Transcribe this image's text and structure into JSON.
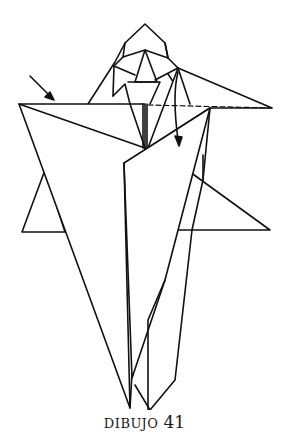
{
  "figure": {
    "type": "origami-diagram",
    "caption_word": "DIBUJO",
    "caption_number": "41",
    "symbols": [
      {
        "name": "push-arrow",
        "description": "straight arrow pointing to top-left edge"
      },
      {
        "name": "fold-arrow",
        "description": "curved arrow showing flap folding down"
      },
      {
        "name": "valley-fold-line",
        "description": "dashed line along top right edge"
      }
    ],
    "colors": {
      "line": "#111111",
      "background": "#ffffff"
    }
  }
}
